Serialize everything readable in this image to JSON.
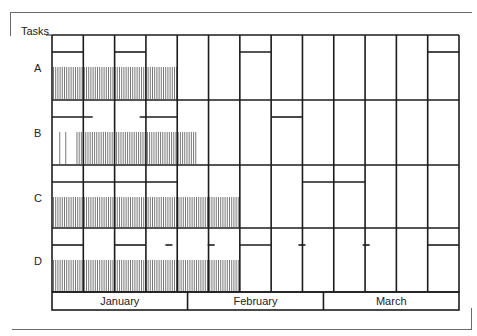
{
  "chart_data": {
    "type": "gantt",
    "title": "",
    "ylabel": "Tasks",
    "xlabel": "",
    "weeks": 13,
    "months": [
      {
        "label": "January",
        "start_week": 0,
        "end_week": 4.33
      },
      {
        "label": "February",
        "start_week": 4.33,
        "end_week": 8.67
      },
      {
        "label": "March",
        "start_week": 8.67,
        "end_week": 13
      }
    ],
    "tasks": [
      {
        "name": "A",
        "planned_bars": [
          {
            "start": 0,
            "end": 1
          },
          {
            "start": 2,
            "end": 3
          },
          {
            "start": 6,
            "end": 7
          },
          {
            "start": 12,
            "end": 13
          }
        ],
        "progress": [
          {
            "start": 0,
            "end": 4
          }
        ],
        "stripe_dashes": []
      },
      {
        "name": "B",
        "planned_bars": [
          {
            "start": 0,
            "end": 1.3
          },
          {
            "start": 2.8,
            "end": 4
          },
          {
            "start": 7,
            "end": 8
          }
        ],
        "progress": [
          {
            "start": 0.2,
            "end": 0.45,
            "sparse": true
          },
          {
            "start": 0.75,
            "end": 4.6
          }
        ],
        "stripe_dashes": []
      },
      {
        "name": "C",
        "planned_bars": [
          {
            "start": 0,
            "end": 4
          },
          {
            "start": 8,
            "end": 10
          }
        ],
        "progress": [
          {
            "start": 0,
            "end": 6
          }
        ],
        "stripe_dashes": []
      },
      {
        "name": "D",
        "planned_bars": [
          {
            "start": 0,
            "end": 1
          },
          {
            "start": 2,
            "end": 3
          },
          {
            "start": 6,
            "end": 7
          },
          {
            "start": 12,
            "end": 13
          }
        ],
        "progress": [
          {
            "start": 0,
            "end": 6
          }
        ],
        "stripe_dashes": [
          3.75,
          5.1,
          8.0,
          10.05
        ]
      }
    ]
  }
}
